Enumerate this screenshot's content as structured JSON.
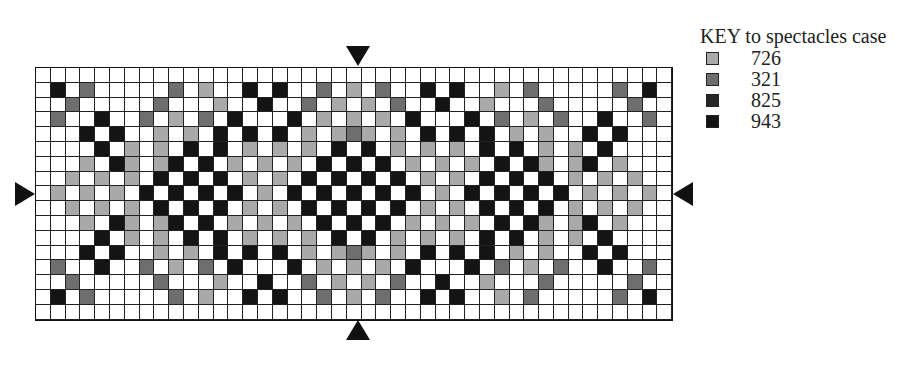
{
  "key": {
    "title": "KEY to spectacles case",
    "items": [
      {
        "code": "L",
        "label": "726",
        "color": "#a9a9a9"
      },
      {
        "code": "M",
        "label": "321",
        "color": "#6e6e6e"
      },
      {
        "code": "D",
        "label": "825",
        "color": "#262626"
      },
      {
        "code": "K",
        "label": "943",
        "color": "#141414"
      }
    ]
  },
  "grid": {
    "cols": 43,
    "rows": [
      "WWWWWWWWWWWWWWWWWWWWWWWWWWWWWWWWWWWWWWWWWWW",
      "WKWMWWWWWMWLWWKWKWWMWLWMWWKWKWWLWMWWWWWMWKW",
      "WWMWWWWWMWWWLWWKWWMWLWLWMWWKWWLWWWMWWWWWMWW",
      "WMWWKWWMWLWMWKWWWKWLWLWLWKWWWKWMWLWMWWKWWMW",
      "WWWKWKWWLWLWKWKWKWLWLMLWLWKWKWKWLWLWWKWKWWW",
      "WWWWKWLWLWKWKWLWLWLWKWKWLWLWLWKWKWLWLWKWWWW",
      "WWWLWKLWLKWKWLWLWLWKWKWKWLWLWLWKWKLWLKWLWWW",
      "WWLWLWLWKWKWKWLWLWKWKWKWKWLWLWKWKWKWLWLWLWW",
      "WLWLWLWKWKWKWKWLWKWKWKWKWKWLWKWKWKWKWLWLWLW",
      "WWLWLWLWKWKWKWLWLWKWKWKWKWLWLWKWKWKWLWLWLWW",
      "WWWLWKLWLKWKWLWLWLWKWKWKWLWLWLWKWKLWLKWLWWW",
      "WWWWKWLWLWKWKWLWLWLWKWKWLWLWLWKWKWLWLWKWWWW",
      "WWWKWKWWLWLWKWKWKWLWLMLWLWKWKWKWLWLWWKWKWWW",
      "WMWWKWWMWLWMWKWWWKWLWLWLWKWWWKWMWLWMWWKWWMW",
      "WWMWWWWWMWWWLWWKWWMWLWLWMWWKWWLWWWMWWWWWMWW",
      "WKWMWWWWWMWLWWKWKWWMWLWMWWKWKWWLWMWWWWWMWKW",
      "WWWWWWWWWWWWWWWWWWWWWWWWWWWWWWWWWWWWWWWWWWW"
    ],
    "colors": {
      "W": "#ffffff",
      "L": "#a9a9a9",
      "M": "#6e6e6e",
      "D": "#262626",
      "K": "#141414"
    }
  },
  "markers": [
    "top-center",
    "bottom-center",
    "left-middle",
    "right-middle"
  ]
}
